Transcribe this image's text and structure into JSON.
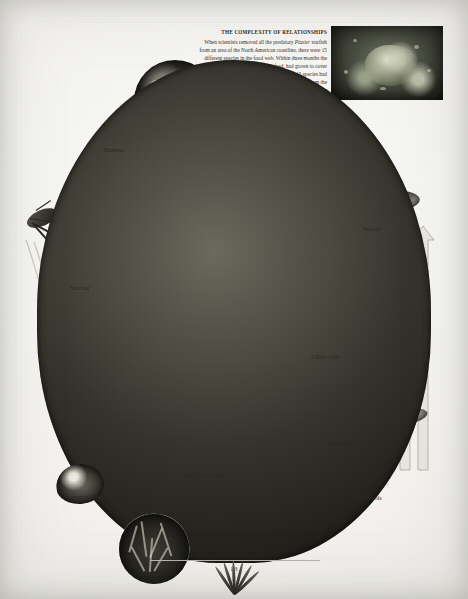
{
  "page": {
    "number": "13",
    "domain": "book-page-food-web-diagram"
  },
  "sidebar_text": {
    "heading": "THE COMPLEXITY OF RELATIONSHIPS",
    "body_part1": "When scientists removed all the predatory ",
    "body_italic1": "Piaster",
    "body_part2": " starfish from an area of the North American coastline, there were 15 different species in the food web. Within three months the barnacles, on which the starfish feed, had grown to cover three-quarters of the area. After a year the 15 species had been reduced to eight. Limpets had disappeared from the area, despite the fact that they are the prey of ",
    "body_italic2": "Piaster",
    "body_part3": ". In the absence of the starfish, the thriving barnacles had taken up all the rocky surfaces, pushing out the algae on which the limpets feed."
  },
  "labels": [
    {
      "id": "humans",
      "text": "Humans",
      "x": 104,
      "y": 147
    },
    {
      "id": "pollack",
      "text": "Pollack",
      "x": 363,
      "y": 226
    },
    {
      "id": "sunstar",
      "text": "Sun star",
      "x": 70,
      "y": 285
    },
    {
      "id": "crab",
      "text": "Edible crab",
      "x": 311,
      "y": 354
    },
    {
      "id": "mullet",
      "text": "Thick-lipped grey mullet",
      "x": 327,
      "y": 440
    },
    {
      "id": "urchin",
      "text": "Edible sea urchin",
      "x": 183,
      "y": 472
    },
    {
      "id": "limpet",
      "text": "Common limpet",
      "x": 66,
      "y": 494
    },
    {
      "id": "seaweeds",
      "text": "Seaweeds",
      "x": 358,
      "y": 495
    },
    {
      "id": "phyto",
      "text": "Phytoplankton",
      "x": 191,
      "y": 539
    }
  ],
  "figures": [
    {
      "id": "cover-photo",
      "name": "algae-and-starfish-photo"
    },
    {
      "id": "humans-photo",
      "name": "humans-harvesting-photo"
    },
    {
      "id": "sunstar-photo",
      "name": "sun-star-illustration"
    },
    {
      "id": "pollack-photo",
      "name": "pollack-fish-illustration"
    },
    {
      "id": "crab-photo",
      "name": "edible-crab-illustration"
    },
    {
      "id": "mullet-photo",
      "name": "grey-mullet-illustration"
    },
    {
      "id": "urchin-photo",
      "name": "sea-urchin-illustration"
    },
    {
      "id": "limpet-photo",
      "name": "common-limpet-illustration"
    },
    {
      "id": "seaweed-photo",
      "name": "seaweeds-illustration"
    },
    {
      "id": "phyto-photo",
      "name": "phytoplankton-micrograph"
    },
    {
      "id": "prawn-photo",
      "name": "crustacean-illustration"
    }
  ],
  "colors": {
    "paper": "#f2f1ee",
    "ink": "#2b2924",
    "arrow_stroke": "#b9b7ae",
    "arrow_fill": "#e9e7e0"
  }
}
